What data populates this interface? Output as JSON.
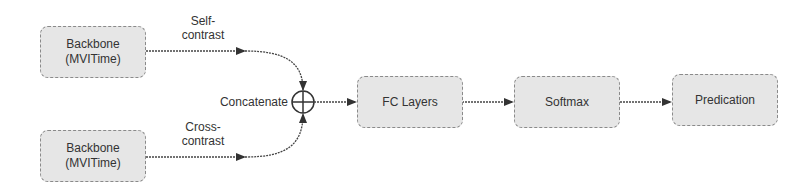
{
  "diagram": {
    "nodes": {
      "backbone_top": {
        "line1": "Backbone",
        "line2": "(MVITime)"
      },
      "backbone_bottom": {
        "line1": "Backbone",
        "line2": "(MVITime)"
      },
      "concat": {
        "label": "Concatenate",
        "symbol": "circle-plus-icon"
      },
      "fc_layers": {
        "label": "FC Layers"
      },
      "softmax": {
        "label": "Softmax"
      },
      "prediction": {
        "label": "Predication"
      }
    },
    "edges": {
      "self_contrast": {
        "line1": "Self-",
        "line2": "contrast"
      },
      "cross_contrast": {
        "line1": "Cross-",
        "line2": "contrast"
      }
    },
    "colors": {
      "box_fill": "#e6e6e6",
      "box_border": "#8a8a8a",
      "line": "#333333",
      "text": "#333333"
    }
  }
}
